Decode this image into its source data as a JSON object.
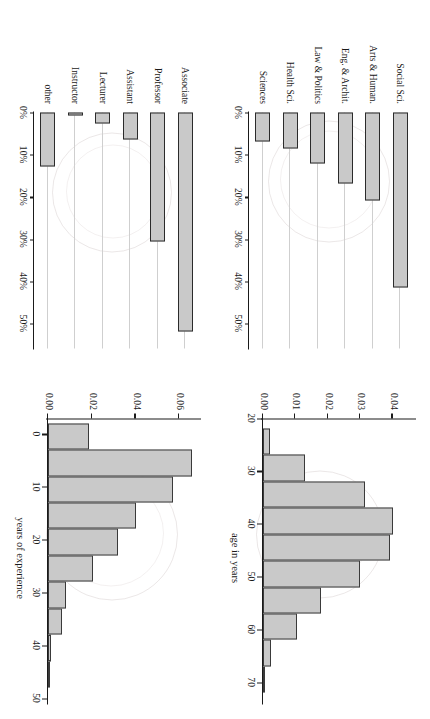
{
  "figure": {
    "orientation": "rotated-90",
    "panel_count": 4,
    "bar_fill_color": "#c9c9c9",
    "bar_border_color": "#2b2b2b",
    "guide_line_color": "#cfcfcf",
    "axis_color": "#1a1a1a",
    "background_color": "#ffffff"
  },
  "panels": {
    "academic_rank": {
      "name": "academic-rank-barplot",
      "categories": [
        "Associate",
        "Professor",
        "Assistant",
        "Lecturer",
        "Instructor",
        "other"
      ],
      "values": [
        52,
        30.5,
        6.5,
        2.6,
        0.3,
        12.8
      ],
      "tick_labels": [
        "0%",
        "10%",
        "20%",
        "30%",
        "40%",
        "50%"
      ],
      "tick_values": [
        0,
        10,
        20,
        30,
        40,
        50
      ],
      "xlim": [
        0,
        55
      ]
    },
    "experience_hist": {
      "name": "years-of-experience-histogram",
      "axis_title": "years of experience",
      "x_tick_labels": [
        "0",
        "10",
        "20",
        "30",
        "40",
        "50"
      ],
      "x_tick_values": [
        0,
        10,
        20,
        30,
        40,
        50
      ],
      "y_tick_labels": [
        "0.00",
        "0.02",
        "0.04",
        "0.06"
      ],
      "y_tick_values": [
        0.0,
        0.02,
        0.04,
        0.06
      ],
      "xlim": [
        -3,
        50
      ],
      "ylim": [
        0,
        0.068
      ],
      "bin_edges": [
        -2,
        3,
        8,
        13,
        18,
        23,
        28,
        33,
        38,
        43,
        48
      ],
      "densities": [
        0.0185,
        0.0655,
        0.057,
        0.04,
        0.032,
        0.0205,
        0.008,
        0.0065,
        0.0012,
        0.0008
      ]
    },
    "discipline": {
      "name": "discipline-barplot",
      "categories": [
        "Social Sci.",
        "Arts & Human.",
        "Eng. & Archit.",
        "Law & Politics",
        "Health Sci.",
        "Sciences"
      ],
      "values": [
        41.5,
        20.8,
        16.8,
        12.0,
        8.6,
        6.8
      ],
      "tick_labels": [
        "0%",
        "10%",
        "20%",
        "30%",
        "40%",
        "50%"
      ],
      "tick_values": [
        0,
        10,
        20,
        30,
        40,
        50
      ],
      "xlim": [
        0,
        55
      ]
    },
    "age_hist": {
      "name": "age-in-years-histogram",
      "axis_title": "age in years",
      "x_tick_labels": [
        "20",
        "30",
        "40",
        "50",
        "60",
        "70"
      ],
      "x_tick_values": [
        20,
        30,
        40,
        50,
        60,
        70
      ],
      "y_tick_labels": [
        "0.00",
        "0.01",
        "0.02",
        "0.03",
        "0.04"
      ],
      "y_tick_values": [
        0.0,
        0.01,
        0.02,
        0.03,
        0.04
      ],
      "xlim": [
        20,
        73
      ],
      "ylim": [
        0,
        0.046
      ],
      "bin_edges": [
        22,
        27,
        32,
        37,
        42,
        47,
        52,
        57,
        62,
        67,
        72
      ],
      "densities": [
        0.0022,
        0.013,
        0.0315,
        0.04,
        0.0393,
        0.03,
        0.018,
        0.0105,
        0.0025,
        0.0005
      ]
    }
  }
}
